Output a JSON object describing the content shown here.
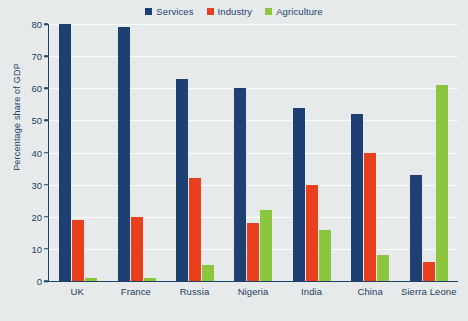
{
  "chart_data": {
    "type": "bar",
    "title": "",
    "subtitle": "",
    "xlabel": "",
    "ylabel": "Percentage share of GDP",
    "categories": [
      "UK",
      "France",
      "Russia",
      "Nigeria",
      "India",
      "China",
      "Sierra Leone"
    ],
    "series": [
      {
        "name": "Services",
        "color": "#1d3f72",
        "values": [
          80,
          79,
          63,
          60,
          54,
          52,
          33
        ]
      },
      {
        "name": "Industry",
        "color": "#e8401c",
        "values": [
          19,
          20,
          32,
          18,
          30,
          40,
          6
        ]
      },
      {
        "name": "Agriculture",
        "color": "#8cc63e",
        "values": [
          1,
          1,
          5,
          22,
          16,
          8,
          61
        ]
      }
    ],
    "ylim": [
      0,
      80
    ],
    "yticks": [
      0,
      10,
      20,
      30,
      40,
      50,
      60,
      70,
      80
    ],
    "ytick_labels": [
      "0",
      "10",
      "20",
      "30",
      "40",
      "50",
      "60",
      "70",
      "80"
    ],
    "grid": true,
    "legend_position": "top-center",
    "background_color": "#e6eaea",
    "gridline_color": "#fbfcfc",
    "axis_color": "#20406b",
    "text_color": "#24405f"
  }
}
